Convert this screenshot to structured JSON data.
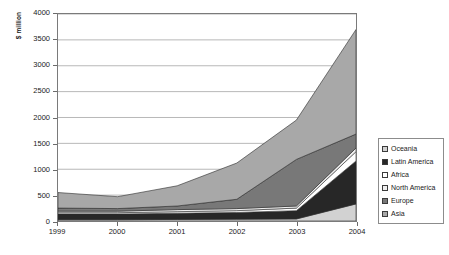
{
  "chart_data": {
    "type": "area",
    "stacked": true,
    "title": "",
    "xlabel": "",
    "ylabel": "$ million",
    "categories": [
      "1999",
      "2000",
      "2001",
      "2002",
      "2003",
      "2004"
    ],
    "x": [
      1999,
      2000,
      2001,
      2002,
      2003,
      2004
    ],
    "ylim": [
      0,
      4000
    ],
    "ytick_step": 500,
    "yticks": [
      "0",
      "500",
      "1000",
      "1500",
      "2000",
      "2500",
      "3000",
      "3500",
      "4000"
    ],
    "ytick_values": [
      0,
      500,
      1000,
      1500,
      2000,
      2500,
      3000,
      3500,
      4000
    ],
    "grid": "horizontal",
    "legend_position": "right",
    "series": [
      {
        "name": "Asia",
        "color": "#a8a8a8",
        "values": [
          300,
          230,
          390,
          700,
          760,
          2020
        ]
      },
      {
        "name": "Europe",
        "color": "#787878",
        "values": [
          60,
          50,
          70,
          180,
          900,
          270
        ]
      },
      {
        "name": "North America",
        "color": "#efefef",
        "values": [
          30,
          30,
          40,
          40,
          40,
          70
        ]
      },
      {
        "name": "Africa",
        "color": "#ffffff",
        "values": [
          25,
          25,
          30,
          35,
          50,
          180
        ]
      },
      {
        "name": "Latin America",
        "color": "#272727",
        "values": [
          110,
          110,
          120,
          130,
          160,
          830
        ]
      },
      {
        "name": "Oceania",
        "color": "#d2d2d2",
        "values": [
          25,
          25,
          30,
          35,
          40,
          330
        ]
      }
    ],
    "totals": [
      550,
      470,
      680,
      1120,
      1950,
      3700
    ]
  },
  "axes": {
    "y_title": "$ million",
    "y_ticks": [
      "4000",
      "3500",
      "3000",
      "2500",
      "2000",
      "1500",
      "1000",
      "500",
      "0"
    ],
    "x_ticks": [
      "1999",
      "2000",
      "2001",
      "2002",
      "2003",
      "2004"
    ]
  },
  "legend": {
    "items": [
      {
        "label": "Oceania",
        "color": "#d2d2d2"
      },
      {
        "label": "Latin America",
        "color": "#272727"
      },
      {
        "label": "Africa",
        "color": "#ffffff"
      },
      {
        "label": "North America",
        "color": "#efefef"
      },
      {
        "label": "Europe",
        "color": "#787878"
      },
      {
        "label": "Asia",
        "color": "#a8a8a8"
      }
    ]
  }
}
